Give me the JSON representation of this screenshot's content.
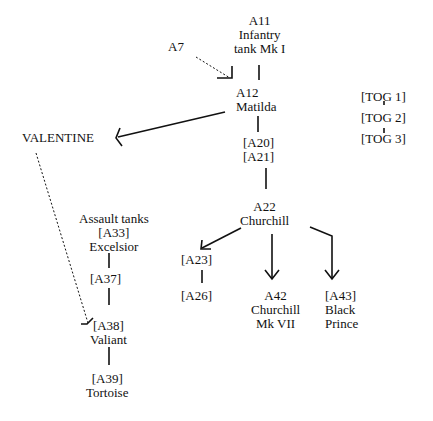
{
  "nodes": {
    "a11": {
      "lines": [
        "A11",
        "Infantry",
        "tank Mk I"
      ]
    },
    "a7": {
      "label": "A7"
    },
    "a12": {
      "lines": [
        "A12",
        "Matilda"
      ]
    },
    "valentine": {
      "label": "VALENTINE"
    },
    "a20a21": {
      "lines": [
        "[A20]",
        "[A21]"
      ]
    },
    "tog": {
      "lines": [
        "[TOG 1]",
        "[TOG 2]",
        "[TOG 3]"
      ]
    },
    "a22": {
      "lines": [
        "A22",
        "Churchill"
      ]
    },
    "assault": {
      "lines": [
        "Assault tanks",
        "[A33]",
        "Excelsior"
      ]
    },
    "a37": {
      "label": "[A37]"
    },
    "a38": {
      "lines": [
        "[A38]",
        "Valiant"
      ]
    },
    "a39": {
      "lines": [
        "[A39]",
        "Tortoise"
      ]
    },
    "a23": {
      "label": "[A23]"
    },
    "a26": {
      "label": "[A26]"
    },
    "a42": {
      "lines": [
        "A42",
        "Churchill",
        "Mk VII"
      ]
    },
    "a43": {
      "lines": [
        "[A43]",
        "Black",
        "Prince"
      ]
    }
  },
  "style": {
    "line_color": "#111111",
    "background": "#ffffff"
  }
}
